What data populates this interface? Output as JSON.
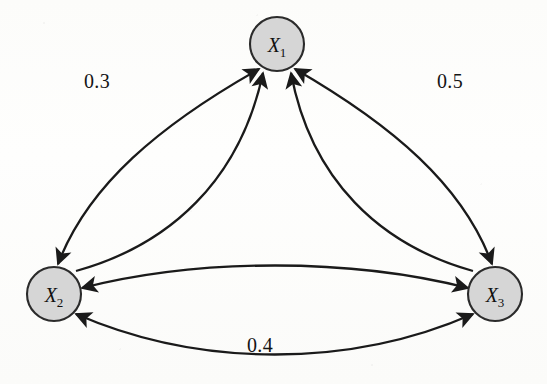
{
  "figure": {
    "kind": "directed-weighted-graph",
    "background_color": "#fdfdfb",
    "node_fill_color": "#d6d6d6",
    "node_stroke_color": "#2b2b2b",
    "edge_color": "#1a1a1a"
  },
  "nodes": [
    {
      "id": "X1",
      "label_base": "X",
      "label_sub": "1",
      "cx": 277,
      "cy": 44,
      "r": 27
    },
    {
      "id": "X2",
      "label_base": "X",
      "label_sub": "2",
      "cx": 54,
      "cy": 294,
      "r": 27
    },
    {
      "id": "X3",
      "label_base": "X",
      "label_sub": "3",
      "cx": 495,
      "cy": 294,
      "r": 27
    }
  ],
  "edges": [
    {
      "id": "e-x1-x2-outer",
      "from": "X1",
      "to": "X2",
      "bidirectional": true,
      "weight": "0.3",
      "label_x": 97,
      "label_y": 88
    },
    {
      "id": "e-x1-x3-outer",
      "from": "X1",
      "to": "X3",
      "bidirectional": true,
      "weight": "0.5",
      "label_x": 450,
      "label_y": 88
    },
    {
      "id": "e-x2-x3-bottom",
      "from": "X2",
      "to": "X3",
      "bidirectional": true,
      "weight": "0.4",
      "label_x": 260,
      "label_y": 352
    },
    {
      "id": "e-x2-x1-inner",
      "from": "X2",
      "to": "X1",
      "bidirectional": false,
      "weight": "",
      "label_x": null,
      "label_y": null
    },
    {
      "id": "e-x3-x1-inner",
      "from": "X3",
      "to": "X1",
      "bidirectional": false,
      "weight": "",
      "label_x": null,
      "label_y": null
    },
    {
      "id": "e-x2-x3-middle",
      "from": "X2",
      "to": "X3",
      "bidirectional": true,
      "weight": "",
      "label_x": null,
      "label_y": null
    }
  ],
  "weights": {
    "x1_x2": "0.3",
    "x1_x3": "0.5",
    "x2_x3": "0.4"
  }
}
